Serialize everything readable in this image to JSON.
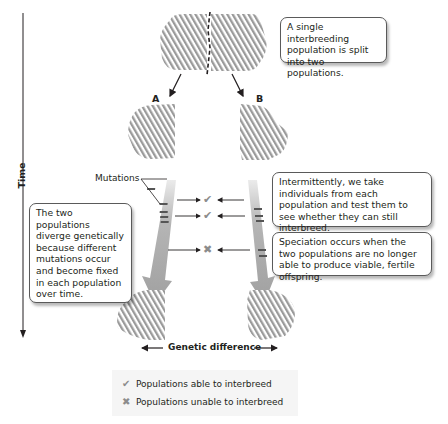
{
  "axes": {
    "time_label": "Time",
    "genetic_difference_label": "Genetic difference"
  },
  "populations": {
    "label_a": "A",
    "label_b": "B"
  },
  "annotations": {
    "mutations_label": "Mutations",
    "split_callout": "A single interbreeding population is split into two populations.",
    "diverge_callout": "The two populations diverge genetically because different mutations occur and become fixed in each population over time.",
    "test_callout": "Intermittently, we take individuals from each population and test them to see whether they can still interbreed.",
    "speciation_callout": "Speciation occurs when the two populations are no longer able to produce viable, fertile offspring."
  },
  "tests": [
    {
      "result": "check",
      "meaning": "able"
    },
    {
      "result": "check",
      "meaning": "able"
    },
    {
      "result": "cross",
      "meaning": "unable"
    }
  ],
  "legend": {
    "items": [
      {
        "glyph": "✔",
        "icon": "check-icon",
        "label": "Populations able to interbreed"
      },
      {
        "glyph": "✖",
        "icon": "cross-icon",
        "label": "Populations unable to interbreed"
      }
    ]
  },
  "colors": {
    "hatch": "#9a9a9a",
    "arrow_gray": "#a6a6a6",
    "mutation_band": "#555555",
    "mark_gray": "#8c8c8c",
    "text": "#231f20"
  }
}
